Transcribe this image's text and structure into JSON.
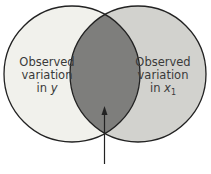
{
  "diagram": {
    "type": "venn",
    "left_circle": {
      "lines": [
        "Observed",
        "variation",
        "in"
      ],
      "variable": "y",
      "fill": "#f1f1ec"
    },
    "right_circle": {
      "lines": [
        "Observed",
        "variation",
        "in"
      ],
      "variable": "x",
      "subscript": "1",
      "fill": "#d2d2ce"
    },
    "overlap": {
      "fill": "#7e7e7c"
    },
    "arrow": {
      "points_to": "overlap"
    }
  }
}
